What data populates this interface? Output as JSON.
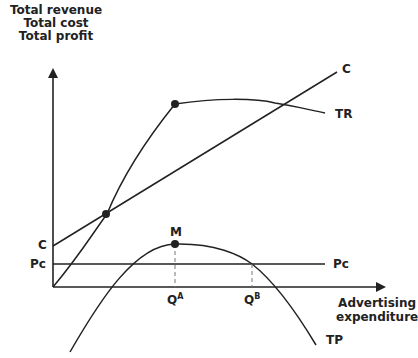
{
  "diagram": {
    "y_axis_label": [
      "Total revenue",
      "Total cost",
      "Total profit"
    ],
    "x_axis_label": [
      "Advertising",
      "expenditure"
    ],
    "curves": {
      "cost": "C",
      "revenue": "TR",
      "profit": "TP",
      "pc_line": "Pc"
    },
    "axis_marks": {
      "c_intercept": "C",
      "pc_intercept": "Pc"
    },
    "points": {
      "max_profit": "M"
    },
    "x_ticks": {
      "qa": {
        "base": "Q",
        "sup": "A"
      },
      "qb": {
        "base": "Q",
        "sup": "B"
      }
    },
    "colors": {
      "line": "#222222",
      "dashed": "#777777",
      "background": "#ffffff"
    }
  }
}
